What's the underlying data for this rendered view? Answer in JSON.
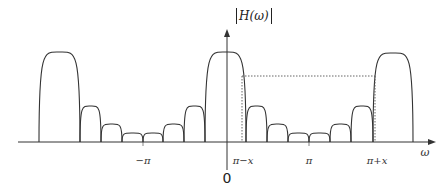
{
  "diagram": {
    "ylabel": "H(ω)",
    "xlabel": "ω",
    "origin_label": "0",
    "tick_labels": [
      {
        "text": "−π",
        "x": 143
      },
      {
        "text": "π−x",
        "x": 242
      },
      {
        "text": "π",
        "x": 309
      },
      {
        "text": "π+x",
        "x": 375
      }
    ],
    "colors": {
      "stroke": "#333333",
      "dotted": "#555555",
      "background": "#ffffff"
    },
    "lobes": [
      {
        "x0": 39,
        "x1": 80,
        "peak": 52,
        "type": "main-alias"
      },
      {
        "x0": 80,
        "x1": 101,
        "peak": 106,
        "type": "sidelobe"
      },
      {
        "x0": 101,
        "x1": 122,
        "peak": 124,
        "type": "sidelobe"
      },
      {
        "x0": 122,
        "x1": 143,
        "peak": 133,
        "type": "sidelobe"
      },
      {
        "x0": 143,
        "x1": 163,
        "peak": 133,
        "type": "sidelobe"
      },
      {
        "x0": 163,
        "x1": 184,
        "peak": 124,
        "type": "sidelobe"
      },
      {
        "x0": 184,
        "x1": 205,
        "peak": 106,
        "type": "sidelobe"
      },
      {
        "x0": 205,
        "x1": 246,
        "peak": 52,
        "type": "main"
      },
      {
        "x0": 246,
        "x1": 267,
        "peak": 106,
        "type": "sidelobe"
      },
      {
        "x0": 267,
        "x1": 288,
        "peak": 124,
        "type": "sidelobe"
      },
      {
        "x0": 288,
        "x1": 309,
        "peak": 133,
        "type": "sidelobe"
      },
      {
        "x0": 309,
        "x1": 330,
        "peak": 133,
        "type": "sidelobe"
      },
      {
        "x0": 330,
        "x1": 351,
        "peak": 124,
        "type": "sidelobe"
      },
      {
        "x0": 351,
        "x1": 373,
        "peak": 106,
        "type": "sidelobe"
      },
      {
        "x0": 373,
        "x1": 413,
        "peak": 53,
        "type": "main-alias"
      }
    ],
    "dotted_level_y": 76,
    "dotted_x_left": 242,
    "dotted_x_right": 375
  }
}
